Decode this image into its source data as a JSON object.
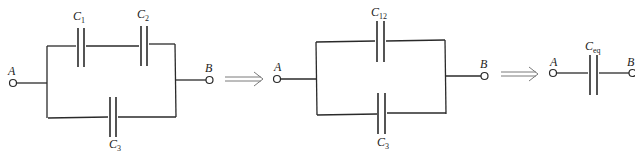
{
  "diagram": {
    "stage1": {
      "terminals": {
        "left": "A",
        "right": "B"
      },
      "capacitors": [
        {
          "label": "C",
          "sub": "1",
          "position": "top-left, series"
        },
        {
          "label": "C",
          "sub": "2",
          "position": "top-right, series"
        },
        {
          "label": "C",
          "sub": "3",
          "position": "bottom, parallel"
        }
      ]
    },
    "stage2": {
      "terminals": {
        "left": "A",
        "right": "B"
      },
      "capacitors": [
        {
          "label": "C",
          "sub": "12",
          "position": "top"
        },
        {
          "label": "C",
          "sub": "3",
          "position": "bottom"
        }
      ]
    },
    "stage3": {
      "terminals": {
        "left": "A",
        "right": "B"
      },
      "capacitors": [
        {
          "label": "C",
          "sub": "eq",
          "position": "single"
        }
      ]
    },
    "arrows": [
      "⟹",
      "⟹"
    ],
    "colors": {
      "wire": "#2a2a2a",
      "arrow": "#7a7a7a",
      "background": "#ffffff"
    }
  }
}
